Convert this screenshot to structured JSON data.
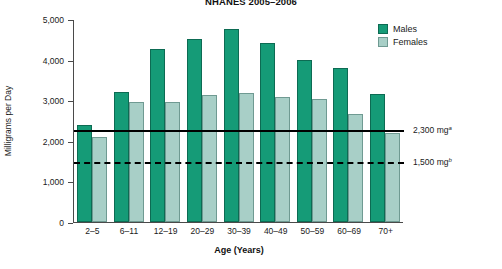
{
  "chart_data": {
    "type": "bar",
    "title": "NHANES 2005–2006",
    "xlabel": "Age (Years)",
    "ylabel": "Milligrams per Day",
    "categories": [
      "2–5",
      "6–11",
      "12–19",
      "20–29",
      "30–39",
      "40–49",
      "50–59",
      "60–69",
      "70+"
    ],
    "series": [
      {
        "name": "Males",
        "color": "#159B77",
        "values": [
          2400,
          3200,
          4250,
          4500,
          4750,
          4400,
          4000,
          3800,
          3150
        ]
      },
      {
        "name": "Females",
        "color": "#A8CFC7",
        "values": [
          2100,
          2950,
          2950,
          3120,
          3180,
          3080,
          3020,
          2650,
          2200
        ]
      }
    ],
    "ylim": [
      0,
      5000
    ],
    "yticks": [
      0,
      1000,
      2000,
      3000,
      4000,
      5000
    ],
    "ytick_labels": [
      "0",
      "1,000",
      "2,000",
      "3,000",
      "4,000",
      "5,000"
    ],
    "grid": false,
    "legend_position": "top-right",
    "reference_lines": [
      {
        "name": "upper-limit",
        "value": 2300,
        "label": "2,300 mg",
        "note": "a",
        "style": "solid"
      },
      {
        "name": "lower-limit",
        "value": 1500,
        "label": "1,500 mg",
        "note": "b",
        "style": "dashed"
      }
    ]
  }
}
